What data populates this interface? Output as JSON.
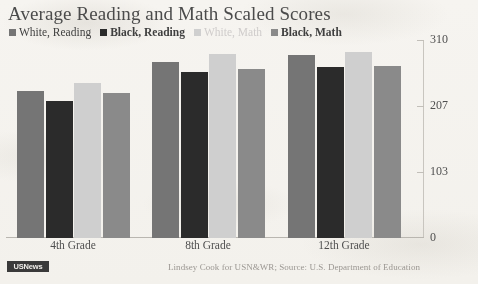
{
  "header": {
    "title": "Average Reading and Math Scaled Scores"
  },
  "legend": {
    "position": "top-left",
    "items": [
      {
        "label": "White, Reading",
        "color": "#757575",
        "swatch_icon": "square-swatch-icon",
        "bold": false
      },
      {
        "label": "Black, Reading",
        "color": "#2b2b2b",
        "swatch_icon": "square-swatch-icon",
        "bold": true
      },
      {
        "label": "White, Math",
        "color": "#cfcfcf",
        "swatch_icon": "square-swatch-icon",
        "bold": false
      },
      {
        "label": "Black, Math",
        "color": "#8a8a8a",
        "swatch_icon": "square-swatch-icon",
        "bold": true
      }
    ]
  },
  "axes": {
    "y_ticks": [
      "310",
      "207",
      "103",
      "0"
    ],
    "y_tick_values": [
      310,
      207,
      103,
      0
    ],
    "x_tick_labels": [
      "4th Grade",
      "8th Grade",
      "12th Grade"
    ]
  },
  "footer": {
    "logo_text": "USNews",
    "credit": "Lindsey Cook for USN&WR; Source: U.S. Department of Education"
  },
  "colors": {
    "background": "#f5f3ef",
    "white_reading": "#757575",
    "black_reading": "#2b2b2b",
    "white_math": "#cfcfcf",
    "black_math": "#8a8a8a",
    "text": "#4b4b4b",
    "axis": "#c2bfb9",
    "credit_text": "#9b9792"
  },
  "chart_data": {
    "type": "bar",
    "title": "Average Reading and Math Scaled Scores",
    "xlabel": "",
    "ylabel": "",
    "ylim": [
      0,
      310
    ],
    "grid": false,
    "legend_position": "top-left",
    "annotation": "Lindsey Cook for USN&WR; Source: U.S. Department of Education",
    "categories": [
      "4th Grade",
      "8th Grade",
      "12th Grade"
    ],
    "series": [
      {
        "name": "White, Reading",
        "color": "#757575",
        "values": [
          230,
          276,
          287
        ]
      },
      {
        "name": "Black, Reading",
        "color": "#2b2b2b",
        "values": [
          214,
          260,
          268
        ]
      },
      {
        "name": "White, Math",
        "color": "#cfcfcf",
        "values": [
          242,
          288,
          291
        ]
      },
      {
        "name": "Black, Math",
        "color": "#8a8a8a",
        "values": [
          227,
          265,
          269
        ]
      }
    ]
  }
}
